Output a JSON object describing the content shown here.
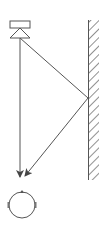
{
  "diagram": {
    "type": "sound-reflection",
    "colors": {
      "stroke": "#555555",
      "background": "#ffffff"
    },
    "elements": {
      "speaker": {
        "label": "",
        "x": 20,
        "box_top": 21,
        "box_height": 7,
        "box_width": 20
      },
      "wall": {
        "label": "",
        "x": 88,
        "top": 20,
        "bottom": 180,
        "hatch_width": 10
      },
      "listener_head": {
        "label": "",
        "cx": 22,
        "cy": 205,
        "r": 13
      },
      "direct_path": {
        "from": [
          20,
          38
        ],
        "to": [
          20,
          178
        ]
      },
      "reflected_path": {
        "from": [
          20,
          38
        ],
        "reflect_at": [
          88,
          98
        ],
        "to": [
          25,
          177
        ]
      }
    }
  }
}
